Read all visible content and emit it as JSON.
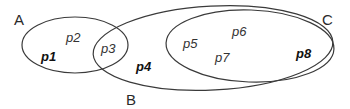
{
  "diagram": {
    "type": "venn",
    "stroke_color": "#3a3a3a",
    "sets": [
      {
        "label": "A",
        "cx": 75,
        "cy": 45,
        "rx": 53,
        "ry": 28,
        "rotate": 0,
        "label_x": 14,
        "label_y": 25
      },
      {
        "label": "B",
        "cx": 213,
        "cy": 48,
        "rx": 120,
        "ry": 42,
        "rotate": -3,
        "label_x": 126,
        "label_y": 105
      },
      {
        "label": "C",
        "cx": 250,
        "cy": 46,
        "rx": 84,
        "ry": 36,
        "rotate": 2,
        "label_x": 322,
        "label_y": 25
      }
    ],
    "regions": [
      {
        "label": "p1",
        "bold": true,
        "x": 41,
        "y": 61
      },
      {
        "label": "p2",
        "bold": false,
        "x": 66,
        "y": 42
      },
      {
        "label": "p3",
        "bold": false,
        "x": 101,
        "y": 53
      },
      {
        "label": "p4",
        "bold": true,
        "x": 136,
        "y": 71
      },
      {
        "label": "p5",
        "bold": false,
        "x": 183,
        "y": 48
      },
      {
        "label": "p6",
        "bold": false,
        "x": 232,
        "y": 36
      },
      {
        "label": "p7",
        "bold": false,
        "x": 215,
        "y": 62
      },
      {
        "label": "p8",
        "bold": true,
        "x": 296,
        "y": 58
      }
    ]
  }
}
